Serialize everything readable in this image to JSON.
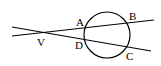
{
  "diagram": {
    "type": "geometry",
    "circle": {
      "cx": 107,
      "cy": 35,
      "r": 23
    },
    "lines": [
      {
        "name": "secant-VAB",
        "x1": 12,
        "y1": 36,
        "x2": 154,
        "y2": 20
      },
      {
        "name": "secant-VDC",
        "x1": 12,
        "y1": 27,
        "x2": 151,
        "y2": 51
      }
    ],
    "labels": [
      {
        "id": "V",
        "text": "V",
        "x": 37,
        "y": 46
      },
      {
        "id": "A",
        "text": "A",
        "x": 76,
        "y": 26
      },
      {
        "id": "B",
        "text": "B",
        "x": 129,
        "y": 20
      },
      {
        "id": "D",
        "text": "D",
        "x": 75,
        "y": 49
      },
      {
        "id": "C",
        "text": "C",
        "x": 126,
        "y": 60
      }
    ]
  }
}
